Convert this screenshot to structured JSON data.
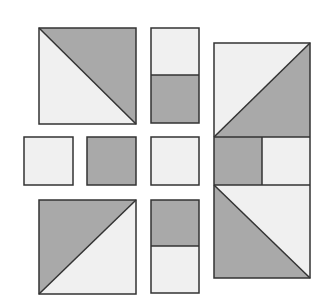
{
  "colors": {
    "background": "#ffffff",
    "dark_fill": "#a9a9a9",
    "light_fill": "#f0f0f0",
    "stroke": "#333333"
  },
  "pieces": [
    {
      "id": "half-square-triangle-top-left",
      "type": "hst",
      "x": 39,
      "y": 28,
      "w": 97,
      "h": 96,
      "diagonal": "tl-br",
      "dark": "upper-right"
    },
    {
      "id": "rect-top-middle",
      "type": "split-rect",
      "x": 151,
      "y": 28,
      "w": 48,
      "h": 95,
      "split": 47,
      "top": "light",
      "bottom": "dark"
    },
    {
      "id": "square-mid-left",
      "type": "square",
      "x": 24,
      "y": 137,
      "w": 49,
      "h": 48,
      "fill": "light"
    },
    {
      "id": "square-mid-center",
      "type": "square",
      "x": 87,
      "y": 137,
      "w": 49,
      "h": 48,
      "fill": "dark"
    },
    {
      "id": "square-mid-right",
      "type": "square",
      "x": 151,
      "y": 137,
      "w": 48,
      "h": 48,
      "fill": "light"
    },
    {
      "id": "half-square-triangle-bottom-left",
      "type": "hst",
      "x": 39,
      "y": 200,
      "w": 97,
      "h": 94,
      "diagonal": "bl-tr",
      "dark": "upper-left"
    },
    {
      "id": "rect-bottom-middle",
      "type": "split-rect",
      "x": 151,
      "y": 200,
      "w": 48,
      "h": 93,
      "split": 46,
      "top": "dark",
      "bottom": "light"
    },
    {
      "id": "assembled-block-right",
      "type": "assembled",
      "x": 214,
      "y": 43,
      "w": 96,
      "h": 235
    }
  ]
}
